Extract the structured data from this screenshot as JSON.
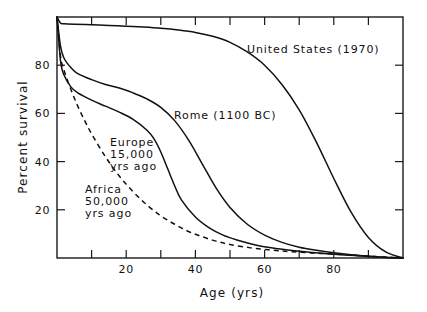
{
  "chart_data": {
    "type": "line",
    "title": "",
    "xlabel": "Age (yrs)",
    "ylabel": "Percent survival",
    "xlim": [
      0,
      100
    ],
    "ylim": [
      0,
      100
    ],
    "xticks": [
      0,
      10,
      20,
      30,
      40,
      50,
      60,
      70,
      80,
      90,
      100
    ],
    "xticklabels": [
      "",
      "",
      "20",
      "",
      "40",
      "",
      "60",
      "",
      "80",
      "",
      ""
    ],
    "yticks": [
      0,
      20,
      40,
      60,
      80,
      100
    ],
    "yticklabels": [
      "",
      "20",
      "40",
      "60",
      "80",
      ""
    ],
    "grid": false,
    "legend": "inline-annotations",
    "series": [
      {
        "name": "United States (1970)",
        "style": "solid",
        "label_text": "United States  (1970)",
        "x": [
          0,
          1,
          2,
          5,
          10,
          15,
          20,
          25,
          30,
          35,
          40,
          45,
          50,
          55,
          60,
          65,
          70,
          75,
          80,
          85,
          90,
          95,
          100
        ],
        "y": [
          100,
          97.5,
          97.2,
          97.0,
          96.8,
          96.5,
          96.2,
          95.8,
          95.3,
          94.6,
          93.6,
          92.0,
          89.5,
          85.5,
          80.0,
          72.0,
          61.5,
          48.0,
          33.0,
          19.0,
          8.5,
          2.5,
          0
        ]
      },
      {
        "name": "Rome (1100 BC)",
        "style": "solid",
        "label_text": "Rome  (1100 BC)",
        "x": [
          0,
          1,
          2,
          4,
          6,
          10,
          14,
          18,
          22,
          26,
          30,
          34,
          38,
          42,
          46,
          50,
          55,
          60,
          65,
          70,
          75,
          80,
          85,
          90,
          95,
          100
        ],
        "y": [
          100,
          88,
          83,
          79,
          76.5,
          74,
          72,
          70.5,
          68.5,
          66,
          62.5,
          57,
          49,
          39,
          29,
          21,
          14,
          9.5,
          6.5,
          4.5,
          3.2,
          2.2,
          1.4,
          0.8,
          0.3,
          0
        ]
      },
      {
        "name": "Europe 15,000 yrs ago",
        "style": "solid",
        "label_text": "Europe\n15,000\nyrs ago",
        "x": [
          0,
          1,
          2,
          4,
          6,
          10,
          14,
          18,
          22,
          26,
          28,
          30,
          32,
          34,
          36,
          40,
          44,
          48,
          52,
          58,
          64,
          70,
          78,
          86,
          94,
          100
        ],
        "y": [
          100,
          82,
          76,
          71,
          68.5,
          65.5,
          63,
          60.5,
          57.5,
          53,
          49.5,
          44,
          37,
          30,
          24,
          17,
          12.5,
          9.5,
          7.5,
          5.2,
          3.8,
          2.8,
          1.8,
          1.0,
          0.3,
          0
        ]
      },
      {
        "name": "Africa 50,000 yrs ago",
        "style": "dashed",
        "label_text": "Africa\n50,000\nyrs ago",
        "x": [
          0,
          1,
          2,
          4,
          6,
          8,
          10,
          14,
          18,
          22,
          26,
          30,
          34,
          38,
          42,
          46,
          50,
          56,
          62,
          68,
          76,
          84,
          92,
          100
        ],
        "y": [
          100,
          84,
          78,
          70,
          63,
          57,
          51.5,
          42,
          34,
          27.5,
          22,
          17.5,
          14,
          11,
          8.8,
          7.0,
          5.6,
          4.2,
          3.3,
          2.6,
          1.9,
          1.3,
          0.6,
          0
        ]
      }
    ],
    "annotations": [
      {
        "id": "us-label",
        "text": "United States  (1970)",
        "x_px": 247,
        "y_px": 49
      },
      {
        "id": "rome-label",
        "text": "Rome  (1100 BC)",
        "x_px": 174,
        "y_px": 115
      },
      {
        "id": "europe-label-line1",
        "text": "Europe",
        "x_px": 110,
        "y_px": 142
      },
      {
        "id": "europe-label-line2",
        "text": "15,000",
        "x_px": 110,
        "y_px": 154
      },
      {
        "id": "europe-label-line3",
        "text": "yrs ago",
        "x_px": 110,
        "y_px": 166
      },
      {
        "id": "africa-label-line1",
        "text": "Africa",
        "x_px": 85,
        "y_px": 189
      },
      {
        "id": "africa-label-line2",
        "text": "50,000",
        "x_px": 85,
        "y_px": 201
      },
      {
        "id": "africa-label-line3",
        "text": "yrs ago",
        "x_px": 85,
        "y_px": 213
      }
    ]
  }
}
